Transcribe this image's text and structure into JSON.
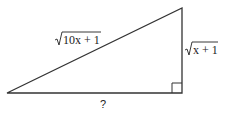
{
  "diagram": {
    "type": "right-triangle",
    "hypotenuse_label": {
      "radical": "√",
      "expr": "10x + 1"
    },
    "vertical_leg_label": {
      "radical": "√",
      "expr": "x + 1"
    },
    "horizontal_leg_label": "?",
    "line_color": "#333333"
  }
}
